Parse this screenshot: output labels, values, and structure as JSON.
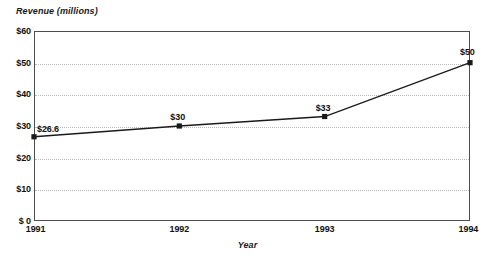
{
  "chart_data": {
    "type": "line",
    "title": "",
    "xlabel": "Year",
    "ylabel": "Revenue (millions)",
    "categories": [
      "1991",
      "1992",
      "1993",
      "1994"
    ],
    "x": [
      1991,
      1992,
      1993,
      1994
    ],
    "values": [
      26.6,
      30,
      33,
      50
    ],
    "point_labels": [
      "$26.6",
      "$30",
      "$33",
      "$50"
    ],
    "ylim": [
      0,
      60
    ],
    "xlim": [
      1991,
      1994
    ],
    "y_ticks": [
      0,
      10,
      20,
      30,
      40,
      50,
      60
    ],
    "y_tick_labels": [
      "$ 0",
      "$10",
      "$20",
      "$30",
      "$40",
      "$50",
      "$60"
    ],
    "x_tick_labels": [
      "1991",
      "1992",
      "1993",
      "1994"
    ],
    "grid": true,
    "grid_axis": "y",
    "legend": false,
    "marker": "square",
    "line_color": "#1a1a1a",
    "grid_color": "#b9b9b9",
    "frame_color": "#4d4d4d"
  }
}
